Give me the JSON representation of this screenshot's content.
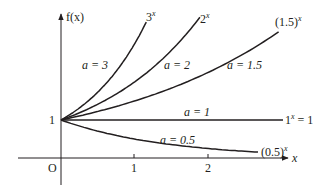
{
  "chart_data": {
    "type": "line",
    "title": "",
    "xlabel": "x",
    "ylabel": "f(x)",
    "origin_label": "O",
    "x_ticks": [
      1,
      2
    ],
    "y_ticks": [
      1
    ],
    "xlim": [
      -0.2,
      3.6
    ],
    "ylim": [
      -0.2,
      3.7
    ],
    "grid": false,
    "legend": "inline",
    "series": [
      {
        "name": "3^x",
        "label_curve": "3",
        "base": 3,
        "param_label": "a = 3",
        "x_end": 1.16
      },
      {
        "name": "2^x",
        "label_curve": "2",
        "base": 2,
        "param_label": "a = 2",
        "x_end": 1.89
      },
      {
        "name": "(1.5)^x",
        "label_curve": "(1.5)",
        "base": 1.5,
        "param_label": "a = 1.5",
        "x_end": 2.96
      },
      {
        "name": "1^x = 1",
        "label_curve": "1",
        "base": 1,
        "param_label": "a = 1",
        "x_end": 3.02
      },
      {
        "name": "(0.5)^x",
        "label_curve": "(0.5)",
        "base": 0.5,
        "param_label": "a = 0.5",
        "x_end": 2.68
      }
    ],
    "annotations": [
      "f(x)",
      "x",
      "O",
      "1",
      "1",
      "2"
    ]
  },
  "labels": {
    "y_axis": "f(x)",
    "x_axis": "x",
    "origin": "O",
    "y_tick_1": "1",
    "x_tick_1": "1",
    "x_tick_2": "2",
    "curve_3": "3",
    "curve_2": "2",
    "curve_15": "(1.5)",
    "curve_1": "1",
    "curve_1_eq": " = 1",
    "curve_05": "(0.5)",
    "exp": "x",
    "param_3": "a = 3",
    "param_2": "a = 2",
    "param_15": "a = 1.5",
    "param_1": "a = 1",
    "param_05": "a = 0.5"
  },
  "colors": {
    "ink": "#231f20",
    "background": "#ffffff"
  }
}
